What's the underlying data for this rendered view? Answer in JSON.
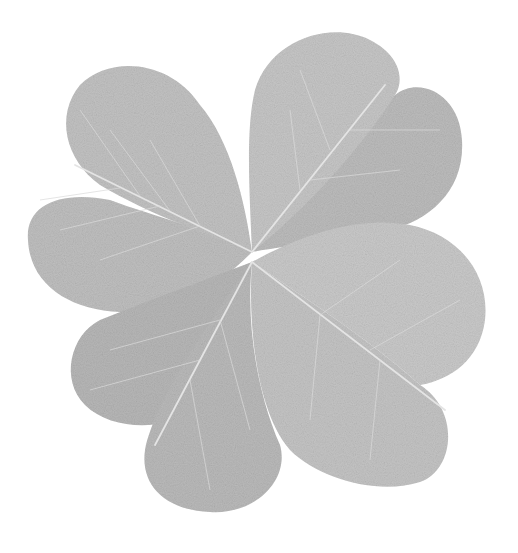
{
  "image": {
    "subject": "four-leaf clover",
    "style": "grayscale",
    "background_color": "#ffffff",
    "leaf_color": "#bdbdbd",
    "leaf_shadow_color": "#a9a9a9",
    "vein_color": "#e6e6e6",
    "leaf_count": 4
  }
}
